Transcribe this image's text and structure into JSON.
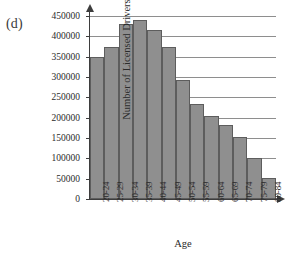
{
  "figure": {
    "label": "(d)"
  },
  "chart_data": {
    "type": "bar",
    "title": "",
    "xlabel": "Age",
    "ylabel": "Number of Licensed Drivers",
    "categories": [
      "20-24",
      "25-29",
      "30-34",
      "35-39",
      "40-44",
      "45-49",
      "50-54",
      "55-59",
      "60-64",
      "65-69",
      "70-74",
      "75-79",
      "80-84"
    ],
    "values": [
      348000,
      375000,
      430000,
      440000,
      415000,
      375000,
      293000,
      234000,
      205000,
      182000,
      152000,
      102000,
      52000
    ],
    "ylim": [
      0,
      450000
    ],
    "yticks": [
      0,
      50000,
      100000,
      150000,
      200000,
      250000,
      300000,
      350000,
      400000,
      450000
    ],
    "ytick_labels": [
      "0",
      "50000",
      "100000",
      "150000",
      "200000",
      "250000",
      "300000",
      "350000",
      "400000",
      "450000"
    ],
    "grid": true,
    "legend": false,
    "bar_color": "#8f8f8f",
    "bar_edge_color": "#5d5d5d",
    "axis_color": "#3d3d3d",
    "grid_color": "#8e8e8e"
  }
}
